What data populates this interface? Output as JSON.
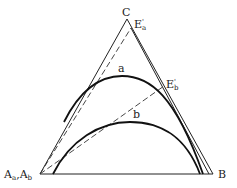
{
  "diagram": {
    "type": "ternary-phase-diagram",
    "vertices": {
      "top": "C",
      "bottom_left": "Aa,Ab",
      "bottom_right": "B"
    },
    "vertex_label_parts": {
      "bottom_left_A1": "A",
      "bottom_left_sub1": "a",
      "bottom_left_sep": ",",
      "bottom_left_A2": "A",
      "bottom_left_sub2": "b"
    },
    "points": [
      {
        "label": "E'a",
        "base": "E",
        "prime": "'",
        "sub": "a"
      },
      {
        "label": "E'b",
        "base": "E",
        "prime": "'",
        "sub": "b"
      }
    ],
    "curves": [
      {
        "label": "a"
      },
      {
        "label": "b"
      }
    ],
    "colors": {
      "line": "#222222",
      "background": "#ffffff"
    }
  }
}
